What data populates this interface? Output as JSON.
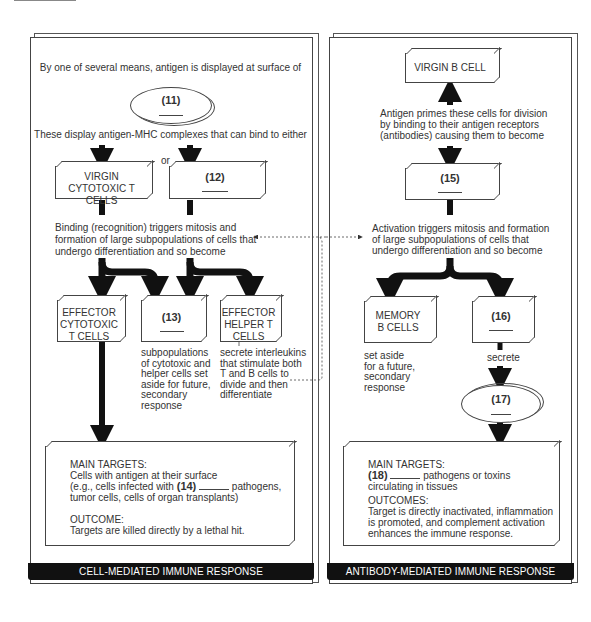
{
  "left_panel": {
    "intro_text": "By one of several means, antigen is displayed at surface of",
    "oval_11": {
      "number": "(11)"
    },
    "display_text": "These display antigen-MHC complexes that can bind to either",
    "or_label": "or",
    "virgin_cytotoxic": {
      "line1": "VIRGIN",
      "line2": "CYTOTOXIC T CELLS"
    },
    "box_12": {
      "number": "(12)"
    },
    "binding_text": [
      "Binding (recognition) triggers mitosis and",
      "formation of large subpopulations of cells that",
      "undergo differentiation and so become"
    ],
    "effector_cytotoxic": {
      "lines": [
        "EFFECTOR",
        "CYTOTOXIC",
        "T CELLS"
      ]
    },
    "box_13": {
      "number": "(13)"
    },
    "effector_helper": {
      "lines": [
        "EFFECTOR",
        "HELPER T",
        "CELLS"
      ]
    },
    "subpop_text": [
      "subpopulations",
      "of cytotoxic and",
      "helper cells set",
      "aside for future,",
      "secondary",
      "response"
    ],
    "interleukin_text": [
      "secrete interleukins",
      "that stimulate both",
      "T and B cells to",
      "divide and then",
      "differentiate"
    ],
    "targets": {
      "heading": "MAIN TARGETS:",
      "line1": "Cells with antigen at their surface",
      "line2_pre": "(e.g., cells infected with",
      "number": "(14)",
      "line2_post": "pathogens,",
      "line3": "tumor cells, cells of organ transplants)",
      "outcome_heading": "OUTCOME:",
      "outcome_text": "Targets are killed directly by a lethal hit."
    },
    "banner": "CELL-MEDIATED IMMUNE RESPONSE"
  },
  "right_panel": {
    "virgin_b": {
      "label": "VIRGIN B CELL"
    },
    "antigen_text": [
      "Antigen primes these cells for division",
      "by binding to their antigen receptors",
      "(antibodies) causing them to become"
    ],
    "box_15": {
      "number": "(15)"
    },
    "activation_text": [
      "Activation triggers mitosis and formation",
      "of large subpopulations of cells that",
      "undergo differentiation and so become"
    ],
    "memory_b": {
      "lines": [
        "MEMORY",
        "B CELLS"
      ]
    },
    "box_16": {
      "number": "(16)"
    },
    "memory_text": [
      "set aside",
      "for a future,",
      "secondary",
      "response"
    ],
    "secrete_label": "secrete",
    "oval_17": {
      "number": "(17)"
    },
    "targets": {
      "heading": "MAIN TARGETS:",
      "number": "(18)",
      "line1_post": "pathogens or toxins",
      "line2": "circulating in tissues",
      "outcome_heading": "OUTCOMES:",
      "outcome_lines": [
        "Target is directly inactivated, inflammation",
        "is promoted, and complement activation",
        "enhances the immune response."
      ]
    },
    "banner": "ANTIBODY-MEDIATED IMMUNE RESPONSE"
  }
}
